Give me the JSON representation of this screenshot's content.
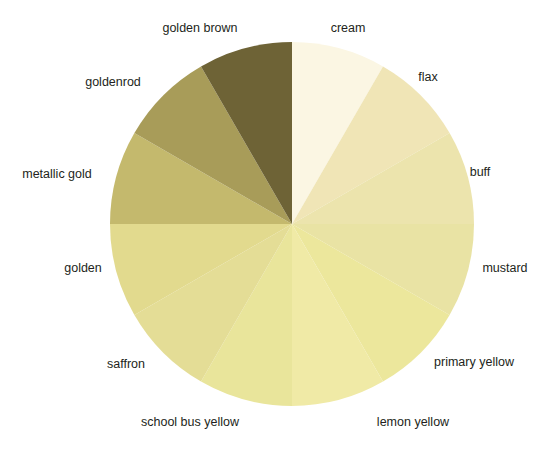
{
  "figure": {
    "width": 551,
    "height": 450,
    "background": "#ffffff",
    "label_color": "#231f20"
  },
  "chart_data": {
    "type": "pie",
    "title": "",
    "xlabel": "",
    "ylabel": "",
    "legend_position": "outside-labels",
    "grid": false,
    "start_angle_deg": 90,
    "direction": "clockwise",
    "center": [
      292,
      224
    ],
    "radius": 182,
    "categories": [
      "cream",
      "flax",
      "buff",
      "mustard",
      "primary yellow",
      "lemon yellow",
      "school bus yellow",
      "saffron",
      "golden",
      "metallic gold",
      "goldenrod",
      "golden brown"
    ],
    "values": [
      8.3333,
      8.3333,
      8.3333,
      8.3333,
      8.3333,
      8.3333,
      8.3333,
      8.3333,
      8.3333,
      8.3333,
      8.3333,
      8.3333
    ],
    "colors": [
      "#fbf6e3",
      "#f0e5b6",
      "#ece4ad",
      "#e9e3a4",
      "#ece79c",
      "#f0eaa6",
      "#e9e59b",
      "#e4dd96",
      "#e2da8e",
      "#c4b96d",
      "#a89c59",
      "#6e6336"
    ],
    "slices": [
      {
        "label": "cream",
        "value": 8.3333,
        "color": "#fbf6e3",
        "start_deg": 0,
        "end_deg": 30,
        "label_pos": [
          348,
          28
        ],
        "label_align": "center"
      },
      {
        "label": "flax",
        "value": 8.3333,
        "color": "#f0e5b6",
        "start_deg": 30,
        "end_deg": 60,
        "label_pos": [
          428,
          77
        ],
        "label_align": "center"
      },
      {
        "label": "buff",
        "value": 8.3333,
        "color": "#ece4ad",
        "start_deg": 60,
        "end_deg": 90,
        "label_pos": [
          480,
          172
        ],
        "label_align": "center"
      },
      {
        "label": "mustard",
        "value": 8.3333,
        "color": "#e9e3a4",
        "start_deg": 90,
        "end_deg": 120,
        "label_pos": [
          505,
          268
        ],
        "label_align": "center"
      },
      {
        "label": "primary yellow",
        "value": 8.3333,
        "color": "#ece79c",
        "start_deg": 120,
        "end_deg": 150,
        "label_pos": [
          474,
          362
        ],
        "label_align": "center"
      },
      {
        "label": "lemon yellow",
        "value": 8.3333,
        "color": "#f0eaa6",
        "start_deg": 150,
        "end_deg": 180,
        "label_pos": [
          413,
          422
        ],
        "label_align": "center"
      },
      {
        "label": "school bus yellow",
        "value": 8.3333,
        "color": "#e9e59b",
        "start_deg": 180,
        "end_deg": 210,
        "label_pos": [
          190,
          422
        ],
        "label_align": "center"
      },
      {
        "label": "saffron",
        "value": 8.3333,
        "color": "#e4dd96",
        "start_deg": 210,
        "end_deg": 240,
        "label_pos": [
          126,
          364
        ],
        "label_align": "center"
      },
      {
        "label": "golden",
        "value": 8.3333,
        "color": "#e2da8e",
        "start_deg": 240,
        "end_deg": 270,
        "label_pos": [
          83,
          268
        ],
        "label_align": "center"
      },
      {
        "label": "metallic gold",
        "value": 8.3333,
        "color": "#c4b96d",
        "start_deg": 270,
        "end_deg": 300,
        "label_pos": [
          57,
          174
        ],
        "label_align": "center"
      },
      {
        "label": "goldenrod",
        "value": 8.3333,
        "color": "#a89c59",
        "start_deg": 300,
        "end_deg": 330,
        "label_pos": [
          113,
          82
        ],
        "label_align": "center"
      },
      {
        "label": "golden brown",
        "value": 8.3333,
        "color": "#6e6336",
        "start_deg": 330,
        "end_deg": 360,
        "label_pos": [
          200,
          28
        ],
        "label_align": "center"
      }
    ]
  }
}
